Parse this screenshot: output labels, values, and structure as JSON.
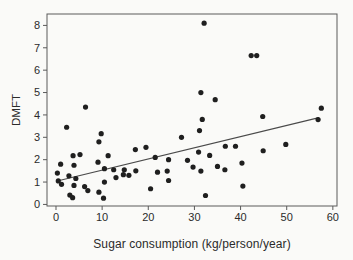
{
  "chart_data": {
    "type": "scatter",
    "title": "",
    "xlabel": "Sugar consumption (kg/person/year)",
    "ylabel": "DMFT",
    "x_axis": {
      "min": -1.95,
      "max": 60.9,
      "ticks": [
        0,
        10,
        20,
        30,
        40,
        50,
        60
      ]
    },
    "y_axis": {
      "min": -0.07,
      "max": 8.51,
      "ticks": [
        0,
        1,
        2,
        3,
        4,
        5,
        6,
        7,
        8
      ]
    },
    "grid": false,
    "legend": "none",
    "points": [
      [
        0.3,
        1.4
      ],
      [
        0.5,
        1.05
      ],
      [
        1.0,
        1.8
      ],
      [
        1.2,
        0.9
      ],
      [
        2.3,
        3.45
      ],
      [
        2.8,
        1.28
      ],
      [
        3.0,
        0.42
      ],
      [
        3.6,
        0.3
      ],
      [
        3.7,
        2.18
      ],
      [
        3.9,
        1.75
      ],
      [
        4.3,
        1.16
      ],
      [
        3.9,
        0.85
      ],
      [
        5.2,
        2.23
      ],
      [
        6.4,
        4.35
      ],
      [
        6.2,
        0.8
      ],
      [
        6.9,
        0.62
      ],
      [
        9.1,
        1.89
      ],
      [
        9.3,
        2.8
      ],
      [
        9.8,
        3.16
      ],
      [
        9.3,
        0.55
      ],
      [
        10.3,
        0.28
      ],
      [
        10.5,
        1.6
      ],
      [
        10.5,
        1.0
      ],
      [
        11.3,
        2.18
      ],
      [
        12.5,
        1.55
      ],
      [
        13.0,
        1.2
      ],
      [
        14.6,
        1.33
      ],
      [
        14.8,
        1.55
      ],
      [
        15.8,
        1.3
      ],
      [
        17.2,
        2.45
      ],
      [
        17.3,
        1.5
      ],
      [
        19.5,
        2.55
      ],
      [
        20.5,
        0.7
      ],
      [
        21.5,
        2.1
      ],
      [
        22.0,
        1.44
      ],
      [
        24.4,
        2.0
      ],
      [
        24.1,
        1.49
      ],
      [
        24.4,
        1.07
      ],
      [
        27.2,
        3.0
      ],
      [
        28.5,
        1.97
      ],
      [
        29.7,
        1.67
      ],
      [
        30.9,
        2.34
      ],
      [
        31.1,
        3.3
      ],
      [
        31.4,
        1.49
      ],
      [
        31.4,
        5.0
      ],
      [
        31.7,
        3.8
      ],
      [
        32.1,
        8.1
      ],
      [
        32.4,
        0.4
      ],
      [
        33.3,
        2.19
      ],
      [
        34.5,
        4.68
      ],
      [
        35.0,
        1.7
      ],
      [
        36.6,
        1.55
      ],
      [
        36.7,
        2.6
      ],
      [
        38.9,
        2.6
      ],
      [
        40.3,
        1.85
      ],
      [
        40.5,
        0.82
      ],
      [
        42.3,
        6.65
      ],
      [
        43.5,
        6.65
      ],
      [
        44.8,
        3.93
      ],
      [
        44.9,
        2.4
      ],
      [
        49.8,
        2.68
      ],
      [
        56.8,
        3.79
      ],
      [
        57.5,
        4.3
      ]
    ],
    "trendline": {
      "x1": 0.5,
      "y1": 1.06,
      "x2": 57.0,
      "y2": 3.88
    },
    "colors": {
      "point": "#1f1f1f",
      "trendline": "#4a4a4a",
      "frame": "#5a5a5a",
      "text": "#2b2b2b",
      "background": "#fafaf8"
    }
  }
}
